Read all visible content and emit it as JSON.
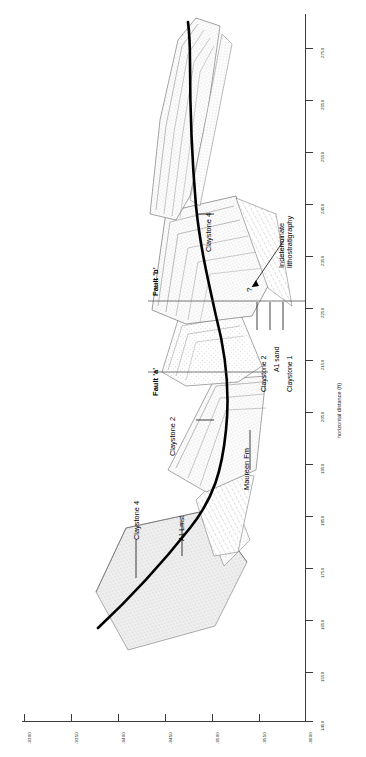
{
  "figure": {
    "type": "geological-cross-section",
    "orientation": "rotated-90-ccw"
  },
  "axes": {
    "depth": {
      "title": "",
      "orientation": "bottom",
      "ticks": [
        "-9300",
        "-9350",
        "-9400",
        "-9450",
        "-9500",
        "-9550",
        "-9600"
      ],
      "min": "-9600",
      "max": "-9300"
    },
    "horizontal": {
      "title": "horizontal distance (ft)",
      "orientation": "right",
      "ticks": [
        "2750",
        "2650",
        "2550",
        "2450",
        "2350",
        "2250",
        "2150",
        "2050",
        "1950",
        "1850",
        "1750",
        "1650",
        "1550",
        "1450"
      ],
      "min": "1450",
      "max": "2750",
      "step": "100",
      "unit": "ft"
    }
  },
  "annotations": {
    "fault_b": "Fault 'b'",
    "fault_a": "Fault 'a'",
    "claystone_4_upper": "Claystone 4",
    "claystone_4_lower": "Claystone 4",
    "claystone_2_mid": "Claystone 2",
    "claystone_2_lead": "Claystone 2",
    "a1_sand": "A1 sand",
    "claystone_1": "Claystone 1",
    "a1_lmst": "A1 Lmst",
    "maureen_fm": "Maureen Fm",
    "indeterminate": "Indeterminate\nlithostratigraphy",
    "query": "?"
  },
  "colors": {
    "wellbore": "#000000",
    "axis": "#3a3a3a",
    "horizon": "#4a4a4a",
    "fill_light": "#f2f2f2",
    "fill_stipple": "#7a7a7a",
    "background": "#ffffff"
  }
}
